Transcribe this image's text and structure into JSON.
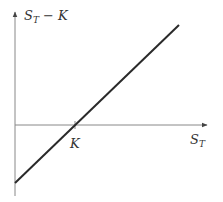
{
  "diagram": {
    "y_axis_label": {
      "main": "S",
      "sub": "T",
      "rest": " − K"
    },
    "x_axis_label": {
      "main": "S",
      "sub": "T"
    },
    "strike_label": "K",
    "colors": {
      "axis": "#888888",
      "line": "#2a2a2a",
      "text": "#333333",
      "background": "#ffffff"
    },
    "geometry": {
      "origin": [
        15,
        125
      ],
      "y_axis_top": 12,
      "y_axis_bottom": 196,
      "x_axis_right": 207,
      "strike_x": 75,
      "line_start": [
        15,
        183
      ],
      "line_end": [
        179,
        25
      ]
    }
  }
}
